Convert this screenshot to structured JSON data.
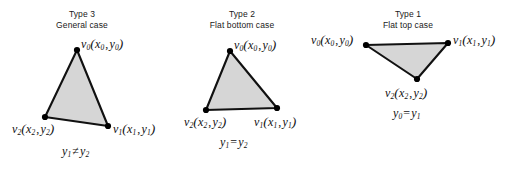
{
  "figure": {
    "background_color": "#ffffff",
    "stroke_color": "#111111",
    "fill_color": "#d6d6d6",
    "vertex_dot_color": "#000000",
    "cases": [
      {
        "id": "type-3",
        "title_line1": "Type 3",
        "title_line2": "General case",
        "vertices": [
          {
            "name": "v0",
            "label_v": "v",
            "label_sub": "0",
            "coord_x": "x",
            "coord_x_sub": "0",
            "coord_y": "y",
            "coord_y_sub": "0",
            "px": 77,
            "py": 50
          },
          {
            "name": "v2",
            "label_v": "v",
            "label_sub": "2",
            "coord_x": "x",
            "coord_x_sub": "2",
            "coord_y": "y",
            "coord_y_sub": "2",
            "px": 45,
            "py": 117
          },
          {
            "name": "v1",
            "label_v": "v",
            "label_sub": "1",
            "coord_x": "x",
            "coord_x_sub": "1",
            "coord_y": "y",
            "coord_y_sub": "1",
            "px": 108,
            "py": 126
          }
        ],
        "relation": {
          "left": "y",
          "left_sub": "1",
          "operator": "≠",
          "right": "y",
          "right_sub": "2"
        }
      },
      {
        "id": "type-2",
        "title_line1": "Type 2",
        "title_line2": "Flat bottom case",
        "vertices": [
          {
            "name": "v0",
            "label_v": "v",
            "label_sub": "0",
            "coord_x": "x",
            "coord_x_sub": "0",
            "coord_y": "y",
            "coord_y_sub": "0",
            "px": 230,
            "py": 51
          },
          {
            "name": "v2",
            "label_v": "v",
            "label_sub": "2",
            "coord_x": "x",
            "coord_x_sub": "2",
            "coord_y": "y",
            "coord_y_sub": "2",
            "px": 206,
            "py": 110
          },
          {
            "name": "v1",
            "label_v": "v",
            "label_sub": "1",
            "coord_x": "x",
            "coord_x_sub": "1",
            "coord_y": "y",
            "coord_y_sub": "1",
            "px": 277,
            "py": 108
          }
        ],
        "relation": {
          "left": "y",
          "left_sub": "1",
          "operator": "=",
          "right": "y",
          "right_sub": "2"
        }
      },
      {
        "id": "type-1",
        "title_line1": "Type 1",
        "title_line2": "Flat top case",
        "vertices": [
          {
            "name": "v0",
            "label_v": "v",
            "label_sub": "0",
            "coord_x": "x",
            "coord_x_sub": "0",
            "coord_y": "y",
            "coord_y_sub": "0",
            "px": 366,
            "py": 45
          },
          {
            "name": "v1",
            "label_v": "v",
            "label_sub": "1",
            "coord_x": "x",
            "coord_x_sub": "1",
            "coord_y": "y",
            "coord_y_sub": "1",
            "px": 448,
            "py": 43
          },
          {
            "name": "v2",
            "label_v": "v",
            "label_sub": "2",
            "coord_x": "x",
            "coord_x_sub": "2",
            "coord_y": "y",
            "coord_y_sub": "2",
            "px": 417,
            "py": 79
          }
        ],
        "relation": {
          "left": "y",
          "left_sub": "0",
          "operator": "=",
          "right": "y",
          "right_sub": "1"
        }
      }
    ]
  }
}
